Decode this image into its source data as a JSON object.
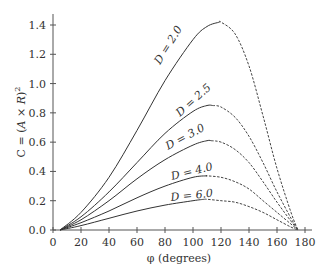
{
  "chart_data": {
    "type": "line",
    "title": "",
    "xlabel": "φ (degrees)",
    "ylabel": "C = (A × R)²",
    "xlim": [
      0,
      180
    ],
    "ylim": [
      0,
      1.4
    ],
    "xticks": [
      0,
      20,
      40,
      60,
      80,
      100,
      120,
      140,
      160,
      180
    ],
    "yticks": [
      "0.0",
      "0.2",
      "0.4",
      "0.6",
      "0.8",
      "1.0",
      "1.2",
      "1.4"
    ],
    "grid": false,
    "legend": "inline labels on curves",
    "x": [
      5,
      20,
      40,
      60,
      80,
      100,
      110,
      120,
      130,
      140,
      150,
      160,
      170,
      175
    ],
    "series": [
      {
        "name": "D = 2.0",
        "label": "D = 2.0",
        "peak": [
          119,
          1.42
        ],
        "values": [
          0.0,
          0.12,
          0.36,
          0.68,
          1.02,
          1.3,
          1.39,
          1.42,
          1.34,
          1.12,
          0.78,
          0.42,
          0.12,
          0.0
        ]
      },
      {
        "name": "D = 2.5",
        "label": "D = 2.5",
        "peak": [
          114,
          0.85
        ],
        "values": [
          0.0,
          0.09,
          0.26,
          0.46,
          0.66,
          0.81,
          0.85,
          0.84,
          0.77,
          0.64,
          0.46,
          0.26,
          0.08,
          0.0
        ]
      },
      {
        "name": "D = 3.0",
        "label": "D = 3.0",
        "peak": [
          113,
          0.61
        ],
        "values": [
          0.0,
          0.07,
          0.2,
          0.35,
          0.48,
          0.58,
          0.61,
          0.6,
          0.55,
          0.46,
          0.33,
          0.19,
          0.06,
          0.0
        ]
      },
      {
        "name": "D = 4.0",
        "label": "D = 4.0",
        "peak": [
          110,
          0.37
        ],
        "values": [
          0.0,
          0.05,
          0.13,
          0.22,
          0.3,
          0.36,
          0.37,
          0.36,
          0.33,
          0.28,
          0.2,
          0.12,
          0.04,
          0.0
        ]
      },
      {
        "name": "D = 6.0",
        "label": "D = 6.0",
        "peak": [
          108,
          0.21
        ],
        "values": [
          0.0,
          0.03,
          0.08,
          0.13,
          0.17,
          0.2,
          0.21,
          0.2,
          0.19,
          0.16,
          0.12,
          0.07,
          0.02,
          0.0
        ]
      }
    ],
    "line_style_note": "solid up to peak, dashed after peak"
  },
  "labels": {
    "xlabel": "φ (degrees)",
    "ylabel_prefix": "C = (",
    "ylabel_italic": "A × R",
    "ylabel_suffix": ")",
    "ylabel_sup": "2"
  }
}
